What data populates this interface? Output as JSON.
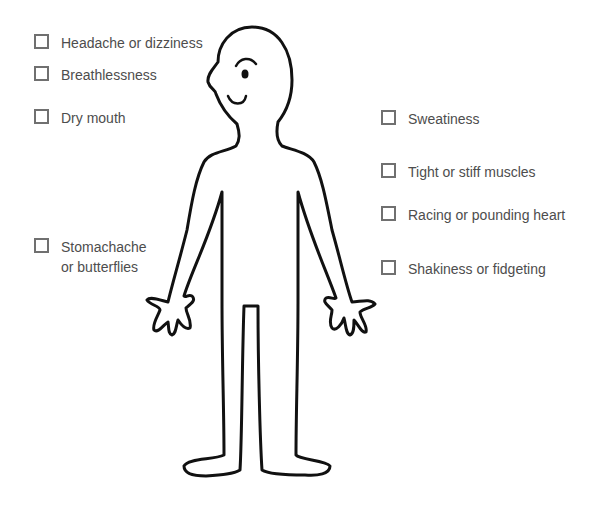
{
  "symptoms_left": [
    {
      "label": "Headache or dizziness",
      "x": 34,
      "y": 33
    },
    {
      "label": "Breathlessness",
      "x": 34,
      "y": 65
    },
    {
      "label": "Dry mouth",
      "x": 34,
      "y": 108
    },
    {
      "label": "Stomachache\nor butterflies",
      "x": 34,
      "y": 237
    }
  ],
  "symptoms_right": [
    {
      "label": "Sweatiness",
      "x": 381,
      "y": 109
    },
    {
      "label": "Tight or stiff muscles",
      "x": 381,
      "y": 162
    },
    {
      "label": "Racing or pounding heart",
      "x": 381,
      "y": 205
    },
    {
      "label": "Shakiness or fidgeting",
      "x": 381,
      "y": 259
    }
  ],
  "figure": {
    "name": "body-outline",
    "stroke": "#111111"
  }
}
